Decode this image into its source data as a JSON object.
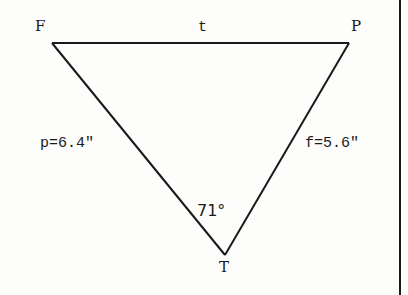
{
  "diagram": {
    "type": "triangle",
    "vertices": {
      "F": {
        "label": "F",
        "x": 52,
        "y": 43
      },
      "P": {
        "label": "P",
        "x": 349,
        "y": 43
      },
      "T": {
        "label": "T",
        "x": 225,
        "y": 255
      }
    },
    "sides": {
      "t": {
        "label": "t",
        "from": "F",
        "to": "P"
      },
      "p": {
        "label": "p=6.4\"",
        "from": "F",
        "to": "T"
      },
      "f": {
        "label": "f=5.6\"",
        "from": "P",
        "to": "T"
      }
    },
    "angle_T": {
      "label": "71°",
      "vertex": "T"
    },
    "line_color": "#1a1a1a",
    "background_color": "#fdfdfc"
  }
}
